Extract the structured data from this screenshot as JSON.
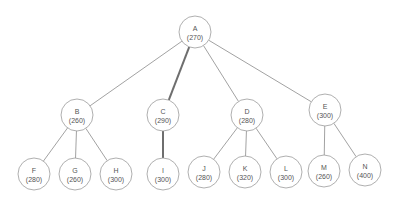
{
  "diagram": {
    "type": "tree",
    "node_radius": 16,
    "colors": {
      "edge": "#8a8a8a",
      "highlight_edge": "#6e6e6e",
      "node_stroke": "#9a9a9a",
      "text": "#555555"
    },
    "nodes": [
      {
        "id": "A",
        "label": "A",
        "value": "(270)",
        "x": 195,
        "y": 32
      },
      {
        "id": "B",
        "label": "B",
        "value": "(260)",
        "x": 77,
        "y": 115
      },
      {
        "id": "C",
        "label": "C",
        "value": "(290)",
        "x": 163,
        "y": 115
      },
      {
        "id": "D",
        "label": "D",
        "value": "(280)",
        "x": 247,
        "y": 115
      },
      {
        "id": "E",
        "label": "E",
        "value": "(300)",
        "x": 325,
        "y": 110
      },
      {
        "id": "F",
        "label": "F",
        "value": "(280)",
        "x": 34,
        "y": 174
      },
      {
        "id": "G",
        "label": "G",
        "value": "(260)",
        "x": 75,
        "y": 174
      },
      {
        "id": "H",
        "label": "H",
        "value": "(300)",
        "x": 116,
        "y": 174
      },
      {
        "id": "I",
        "label": "I",
        "value": "(300)",
        "x": 163,
        "y": 174
      },
      {
        "id": "J",
        "label": "J",
        "value": "(280)",
        "x": 204,
        "y": 172
      },
      {
        "id": "K",
        "label": "K",
        "value": "(320)",
        "x": 245,
        "y": 172
      },
      {
        "id": "L",
        "label": "L",
        "value": "(300)",
        "x": 286,
        "y": 172
      },
      {
        "id": "M",
        "label": "M",
        "value": "(260)",
        "x": 324,
        "y": 171
      },
      {
        "id": "N",
        "label": "N",
        "value": "(400)",
        "x": 365,
        "y": 170
      }
    ],
    "edges": [
      {
        "from": "A",
        "to": "B",
        "highlight": false
      },
      {
        "from": "A",
        "to": "C",
        "highlight": true
      },
      {
        "from": "A",
        "to": "D",
        "highlight": false
      },
      {
        "from": "A",
        "to": "E",
        "highlight": false
      },
      {
        "from": "B",
        "to": "F",
        "highlight": false
      },
      {
        "from": "B",
        "to": "G",
        "highlight": false
      },
      {
        "from": "B",
        "to": "H",
        "highlight": false
      },
      {
        "from": "C",
        "to": "I",
        "highlight": true
      },
      {
        "from": "D",
        "to": "J",
        "highlight": false
      },
      {
        "from": "D",
        "to": "K",
        "highlight": false
      },
      {
        "from": "D",
        "to": "L",
        "highlight": false
      },
      {
        "from": "E",
        "to": "M",
        "highlight": false
      },
      {
        "from": "E",
        "to": "N",
        "highlight": false
      }
    ]
  }
}
